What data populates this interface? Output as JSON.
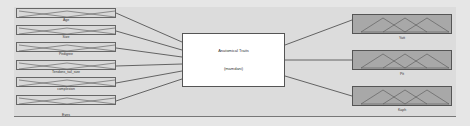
{
  "diagram": {
    "inputs": [
      {
        "label": "Age"
      },
      {
        "label": "Size"
      },
      {
        "label": "Pedigree"
      },
      {
        "label": "Tendons_tail_size"
      },
      {
        "label": "complexion"
      },
      {
        "label": "Eyes"
      }
    ],
    "system": {
      "name": "Anatomical Traits",
      "type": "(mamdani)"
    },
    "outputs": [
      {
        "label": "Yatt"
      },
      {
        "label": "Pit"
      },
      {
        "label": "Kaph"
      }
    ],
    "colors": {
      "background": "#e6e6e6",
      "input_box": "#d8d8d8",
      "output_box": "#a8a8a8",
      "system_box": "#ffffff",
      "lines": "#444444"
    }
  }
}
